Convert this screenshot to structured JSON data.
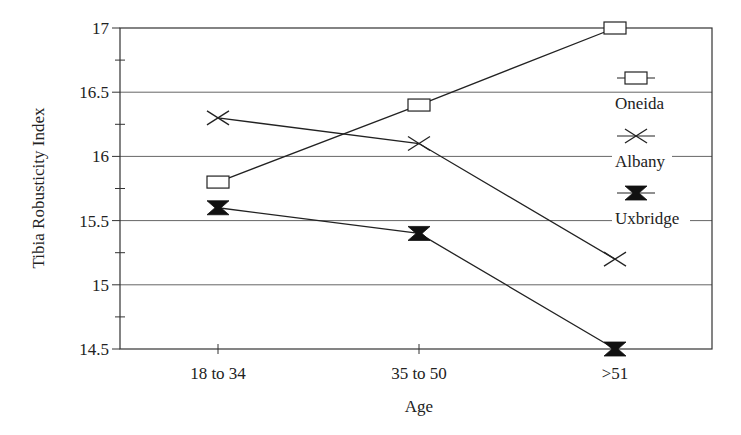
{
  "chart_data": {
    "type": "line",
    "title": "",
    "xlabel": "Age",
    "ylabel": "Tibia Robusticity Index",
    "categories": [
      "18 to 34",
      "35 to 50",
      ">51"
    ],
    "series": [
      {
        "name": "Oneida",
        "marker": "open-square",
        "values": [
          15.8,
          16.4,
          17.0
        ]
      },
      {
        "name": "Albany",
        "marker": "x-cross",
        "values": [
          16.3,
          16.1,
          15.2
        ]
      },
      {
        "name": "Uxbridge",
        "marker": "filled-hourglass",
        "values": [
          15.6,
          15.4,
          14.5
        ]
      }
    ],
    "ylim": [
      14.5,
      17
    ],
    "yticks": [
      "14.5",
      "15",
      "15.5",
      "16",
      "16.5",
      "17"
    ],
    "grid": true,
    "legend_position": "right-inside"
  },
  "colors": {
    "line": "#222222",
    "grid": "#555555",
    "background": "#ffffff"
  }
}
